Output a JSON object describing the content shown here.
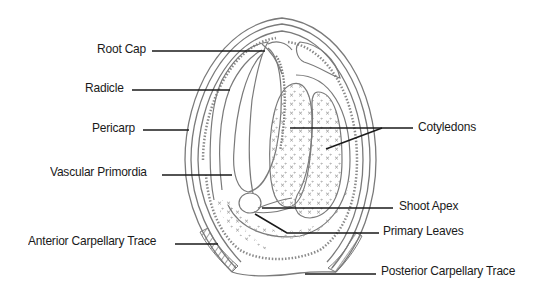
{
  "diagram": {
    "colors": {
      "outline": "#7a7a7a",
      "leader": "#1a1a1a",
      "text": "#1a1a1a",
      "background": "#ffffff"
    },
    "labels": [
      {
        "id": "root-cap",
        "text": "Root Cap",
        "side": "left"
      },
      {
        "id": "radicle",
        "text": "Radicle",
        "side": "left"
      },
      {
        "id": "pericarp",
        "text": "Pericarp",
        "side": "left"
      },
      {
        "id": "vascular-primordia",
        "text": "Vascular Primordia",
        "side": "left"
      },
      {
        "id": "anterior-carpellary-trace",
        "text": "Anterior Carpellary Trace",
        "side": "left"
      },
      {
        "id": "cotyledons",
        "text": "Cotyledons",
        "side": "right"
      },
      {
        "id": "shoot-apex",
        "text": "Shoot Apex",
        "side": "right"
      },
      {
        "id": "primary-leaves",
        "text": "Primary Leaves",
        "side": "right"
      },
      {
        "id": "posterior-carpellary-trace",
        "text": "Posterior Carpellary Trace",
        "side": "right"
      }
    ]
  }
}
